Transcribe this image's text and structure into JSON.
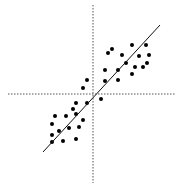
{
  "chart_data": {
    "type": "scatter",
    "title": "",
    "xlabel": "",
    "ylabel": "",
    "grid": false,
    "legend": null,
    "axes": {
      "x_axis_pixel_y": 94,
      "y_axis_pixel_x": 93,
      "style": "dotted",
      "color": "#555555"
    },
    "trend_line": {
      "x1": 43,
      "y1": 152,
      "x2": 160,
      "y2": 25,
      "color": "#111111"
    },
    "point_color": "#000000",
    "point_radius": 2,
    "points": [
      [
        108,
        53
      ],
      [
        112,
        49
      ],
      [
        132,
        45
      ],
      [
        146,
        45
      ],
      [
        122,
        55
      ],
      [
        139,
        56
      ],
      [
        149,
        55
      ],
      [
        126,
        63
      ],
      [
        135,
        67
      ],
      [
        143,
        67
      ],
      [
        147,
        63
      ],
      [
        118,
        70
      ],
      [
        132,
        74
      ],
      [
        105,
        70
      ],
      [
        105,
        81
      ],
      [
        118,
        80
      ],
      [
        87,
        80
      ],
      [
        83,
        88
      ],
      [
        101,
        99
      ],
      [
        87,
        103
      ],
      [
        76,
        103
      ],
      [
        73,
        109
      ],
      [
        76,
        114
      ],
      [
        55,
        116
      ],
      [
        66,
        116
      ],
      [
        83,
        120
      ],
      [
        52,
        124
      ],
      [
        69,
        128
      ],
      [
        79,
        127
      ],
      [
        59,
        131
      ],
      [
        52,
        135
      ],
      [
        52,
        142
      ],
      [
        63,
        141
      ],
      [
        76,
        139
      ]
    ]
  }
}
